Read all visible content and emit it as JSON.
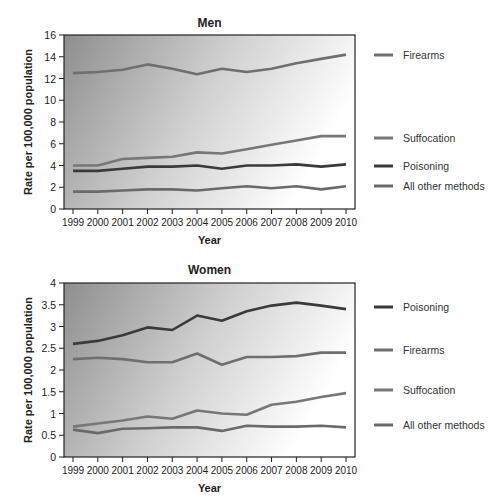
{
  "chart_data": [
    {
      "type": "line",
      "title": "Men",
      "xlabel": "Year",
      "ylabel": "Rate per 100,000 population",
      "ylim": [
        0,
        16
      ],
      "yticks": [
        0,
        2,
        4,
        6,
        8,
        10,
        12,
        14,
        16
      ],
      "x": [
        "1999",
        "2000",
        "2001",
        "2002",
        "2003",
        "2004",
        "2005",
        "2006",
        "2007",
        "2008",
        "2009",
        "2010"
      ],
      "grid": false,
      "legend_position": "right (inline labels)",
      "series": [
        {
          "name": "Firearms",
          "color": "#6f6f6f",
          "values": [
            12.5,
            12.6,
            12.8,
            13.3,
            12.9,
            12.4,
            12.9,
            12.6,
            12.9,
            13.4,
            13.8,
            14.2
          ]
        },
        {
          "name": "Suffocation",
          "color": "#777777",
          "values": [
            4.0,
            4.0,
            4.6,
            4.7,
            4.8,
            5.2,
            5.1,
            5.5,
            5.9,
            6.3,
            6.7,
            6.7
          ]
        },
        {
          "name": "Poisoning",
          "color": "#3a3a3a",
          "values": [
            3.5,
            3.5,
            3.7,
            3.9,
            3.9,
            4.0,
            3.7,
            4.0,
            4.0,
            4.1,
            3.9,
            4.1
          ]
        },
        {
          "name": "All other methods",
          "color": "#6a6a6a",
          "values": [
            1.6,
            1.6,
            1.7,
            1.8,
            1.8,
            1.7,
            1.9,
            2.1,
            1.9,
            2.1,
            1.8,
            2.1
          ]
        }
      ]
    },
    {
      "type": "line",
      "title": "Women",
      "xlabel": "Year",
      "ylabel": "Rate per 100,000 population",
      "ylim": [
        0,
        4
      ],
      "yticks": [
        0,
        0.5,
        1,
        1.5,
        2,
        2.5,
        3,
        3.5,
        4
      ],
      "x": [
        "1999",
        "2000",
        "2001",
        "2002",
        "2003",
        "2004",
        "2005",
        "2006",
        "2007",
        "2008",
        "2009",
        "2010"
      ],
      "grid": false,
      "legend_position": "right (inline labels)",
      "series": [
        {
          "name": "Poisoning",
          "color": "#3a3a3a",
          "values": [
            2.6,
            2.67,
            2.8,
            2.98,
            2.92,
            3.25,
            3.13,
            3.35,
            3.48,
            3.55,
            3.48,
            3.4
          ]
        },
        {
          "name": "Firearms",
          "color": "#6f6f6f",
          "values": [
            2.25,
            2.28,
            2.25,
            2.18,
            2.18,
            2.38,
            2.12,
            2.3,
            2.3,
            2.32,
            2.4,
            2.4
          ]
        },
        {
          "name": "Suffocation",
          "color": "#777777",
          "values": [
            0.7,
            0.77,
            0.84,
            0.93,
            0.88,
            1.07,
            1.0,
            0.97,
            1.2,
            1.27,
            1.38,
            1.47
          ]
        },
        {
          "name": "All other methods",
          "color": "#6a6a6a",
          "values": [
            0.63,
            0.55,
            0.65,
            0.66,
            0.68,
            0.68,
            0.6,
            0.72,
            0.7,
            0.7,
            0.72,
            0.68
          ]
        }
      ]
    }
  ],
  "men": {
    "title": "Men",
    "xlabel": "Year",
    "ylabel": "Rate per 100,000 population",
    "legend": [
      "Firearms",
      "Suffocation",
      "Poisoning",
      "All other methods"
    ]
  },
  "women": {
    "title": "Women",
    "xlabel": "Year",
    "ylabel": "Rate per 100,000 population",
    "legend": [
      "Poisoning",
      "Firearms",
      "Suffocation",
      "All other methods"
    ]
  }
}
